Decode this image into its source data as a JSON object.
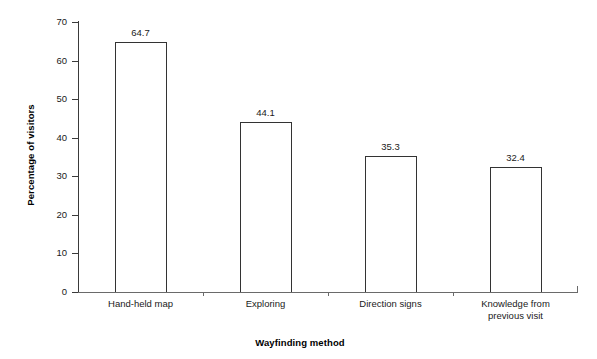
{
  "chart_data": {
    "type": "bar",
    "title": "",
    "subtitle": "",
    "xlabel": "Wayfinding method",
    "ylabel": "Percentage of visitors",
    "categories": [
      "Hand-held map",
      "Exploring",
      "Direction signs",
      "Knowledge from\nprevious visit"
    ],
    "values": [
      64.7,
      44.1,
      35.3,
      32.4
    ],
    "value_labels": [
      "64.7",
      "44.1",
      "35.3",
      "32.4"
    ],
    "ylim": [
      0,
      70
    ],
    "ytick_labels": [
      "0",
      "10",
      "20",
      "30",
      "40",
      "50",
      "60",
      "70"
    ],
    "ytick_values": [
      0,
      10,
      20,
      30,
      40,
      50,
      60,
      70
    ],
    "grid": false,
    "legend": null,
    "bar_fill_color": "#ffffff",
    "bar_edge_color": "#333333",
    "axis_color": "#3a3a3a",
    "text_color": "#1a1a1a",
    "background_color": "#ffffff"
  }
}
